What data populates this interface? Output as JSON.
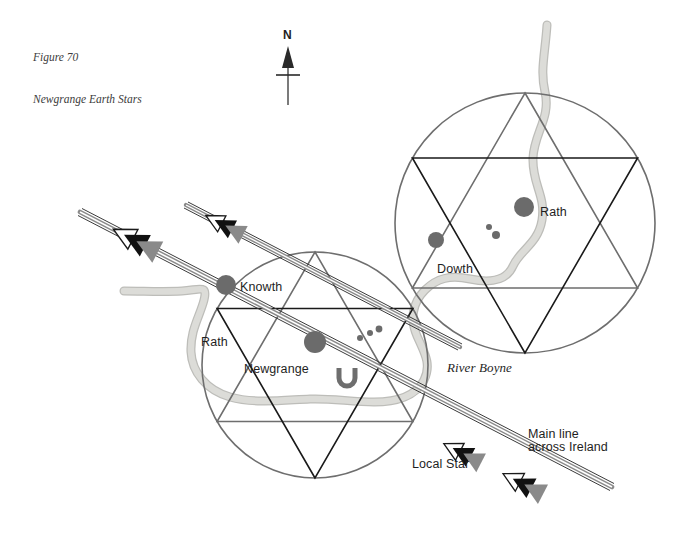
{
  "figure": {
    "caption_line1": "Figure 70",
    "caption_line2": "Newgrange Earth Stars"
  },
  "compass": {
    "label": "N",
    "name": "north-arrow"
  },
  "colors": {
    "background": "#ffffff",
    "circle_outline": "#6e6e6e",
    "triangle_dark": "#1a1a1a",
    "triangle_gray": "#6e6e6e",
    "river": "#d6d6d2",
    "river_edge": "#bcbcb8",
    "site_marker": "#6b6b6b",
    "line_gray": "#8a8a8a",
    "line_dark": "#3a3a3a",
    "arrow_black": "#111111",
    "arrow_gray": "#8a8a8a",
    "arrow_white": "#ffffff",
    "text": "#1e1e1e",
    "caption_text": "#3c3c3c"
  },
  "labels": [
    {
      "id": "rath-upper",
      "text": "Rath",
      "x": 540,
      "y": 205,
      "style": "plain"
    },
    {
      "id": "dowth",
      "text": "Dowth",
      "x": 437,
      "y": 262,
      "style": "plain"
    },
    {
      "id": "knowth",
      "text": "Knowth",
      "x": 240,
      "y": 280,
      "style": "plain"
    },
    {
      "id": "rath-lower",
      "text": "Rath",
      "x": 201,
      "y": 335,
      "style": "plain"
    },
    {
      "id": "newgrange",
      "text": "Newgrange",
      "x": 244,
      "y": 362,
      "style": "plain"
    },
    {
      "id": "river-boyne",
      "text": "River Boyne",
      "x": 447,
      "y": 360,
      "style": "italic"
    },
    {
      "id": "local-star",
      "text": "Local Star",
      "x": 412,
      "y": 457,
      "style": "plain"
    }
  ],
  "main_line_label": {
    "line1": "Main line",
    "line2": "across Ireland",
    "x": 528,
    "y": 428
  },
  "sites": [
    {
      "id": "rath-upper-marker",
      "label": "Rath",
      "cx": 524,
      "cy": 207,
      "r": 10
    },
    {
      "id": "dowth-marker",
      "label": "Dowth",
      "cx": 436,
      "cy": 240,
      "r": 8
    },
    {
      "id": "knowth-marker",
      "label": "Knowth",
      "cx": 226,
      "cy": 285,
      "r": 10
    },
    {
      "id": "newgrange-marker",
      "label": "Newgrange",
      "cx": 315,
      "cy": 342,
      "r": 11
    }
  ],
  "minor_stars": [
    {
      "id": "star-u1",
      "cx": 489,
      "cy": 227,
      "r": 3
    },
    {
      "id": "star-u2",
      "cx": 496,
      "cy": 234,
      "r": 4
    },
    {
      "id": "star-l1",
      "cx": 360,
      "cy": 337,
      "r": 3
    },
    {
      "id": "star-l2",
      "cx": 370,
      "cy": 333,
      "r": 3
    },
    {
      "id": "star-l3",
      "cx": 378,
      "cy": 329,
      "r": 3
    }
  ],
  "star_circles": [
    {
      "id": "upper-star",
      "cx": 525,
      "cy": 223,
      "r": 130,
      "name": "dowth-earth-star"
    },
    {
      "id": "lower-star",
      "cx": 315,
      "cy": 365,
      "r": 113,
      "name": "newgrange-earth-star"
    }
  ],
  "legend_notes": {
    "hexagram_dark": "down-pointing triangle",
    "hexagram_gray": "up-pointing triangle"
  }
}
